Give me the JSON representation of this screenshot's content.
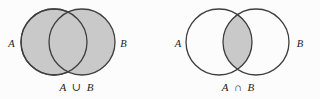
{
  "figure": {
    "colors": {
      "background": "#fcfcfc",
      "shade_fill": "#c9c9c9",
      "circle_stroke": "#3e3e3e",
      "text": "#1c1c1c"
    },
    "union": {
      "label_a": "A",
      "label_b": "B",
      "caption": "A ∪ B"
    },
    "intersection": {
      "label_a": "A",
      "label_b": "B",
      "caption": "A ∩ B"
    }
  }
}
